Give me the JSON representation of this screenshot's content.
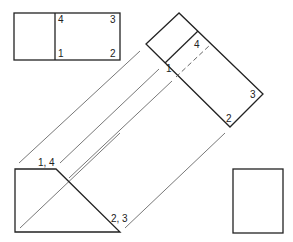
{
  "diagram": {
    "type": "orthographic-auxiliary-view",
    "top_view": {
      "labels": [
        "4",
        "3",
        "1",
        "2"
      ]
    },
    "auxiliary_view": {
      "labels": [
        "4",
        "1",
        "3",
        "2"
      ]
    },
    "front_view": {
      "labels": [
        "1, 4",
        "2, 3"
      ]
    },
    "side_view": {}
  },
  "colors": {
    "stroke": "#222222",
    "projection": "#555555",
    "background": "#ffffff"
  }
}
